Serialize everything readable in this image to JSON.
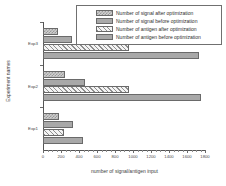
{
  "chart_data": {
    "type": "bar",
    "orientation": "horizontal",
    "title": "",
    "xlabel": "number of signal/antigen input",
    "ylabel": "Experiment names",
    "categories": [
      "Exp1",
      "Exp2",
      "Exp3"
    ],
    "series": [
      {
        "name": "Number of signal after optimization",
        "values": [
          180,
          240,
          170
        ]
      },
      {
        "name": "Number of signal before optimization",
        "values": [
          330,
          470,
          320
        ]
      },
      {
        "name": "Number of antigen after optimization",
        "values": [
          230,
          950,
          950
        ]
      },
      {
        "name": "Number of antigen before optimization",
        "values": [
          440,
          1750,
          1730
        ]
      }
    ],
    "xlim": [
      0,
      1800
    ],
    "xticks": [
      0,
      200,
      400,
      600,
      800,
      1000,
      1200,
      1400,
      1600,
      1800
    ],
    "xtick_labels": [
      "0",
      "200",
      "400",
      "600",
      "800",
      "1000",
      "1200",
      "1400",
      "1600",
      "1800"
    ],
    "grid": false,
    "legend_position": "top-right",
    "colors": {
      "series_0_fill": "#cfcfcf",
      "series_1_fill": "#a8a8a8",
      "series_2_fill": "#f2f2f2",
      "series_3_fill": "#a8a8a8",
      "edge": "#6a6a6a",
      "axis": "#555555",
      "background": "#ffffff"
    },
    "patterns": [
      "checker",
      "solid",
      "diagonal-hatch",
      "solid"
    ]
  },
  "legend": {
    "entries": [
      {
        "label": "Number of signal after optimization"
      },
      {
        "label": "Number of signal before optimization"
      },
      {
        "label": "Number of antigen after optimization"
      },
      {
        "label": "Number of antigen before optimization"
      }
    ]
  }
}
